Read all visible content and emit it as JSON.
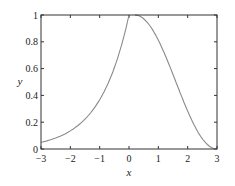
{
  "chart_data": {
    "type": "line",
    "title": "",
    "xlabel": "x",
    "ylabel": "y",
    "xlim": [
      -3,
      3
    ],
    "ylim": [
      0,
      1
    ],
    "xticks": [
      "-3",
      "-2",
      "-1",
      "0",
      "1",
      "2",
      "3"
    ],
    "yticks": [
      "0",
      "0.2",
      "0.4",
      "0.6",
      "0.8",
      "1"
    ],
    "grid": false,
    "legend": null,
    "series": [
      {
        "name": "left branch",
        "x": [
          -3,
          -2.5,
          -2,
          -1.5,
          -1,
          -0.5,
          0
        ],
        "y": [
          0.05,
          0.08,
          0.14,
          0.22,
          0.37,
          0.61,
          1.0
        ]
      },
      {
        "name": "right branch",
        "x": [
          0.2,
          0.5,
          1,
          1.5,
          2,
          2.5,
          3
        ],
        "y": [
          1.0,
          0.97,
          0.63,
          0.42,
          0.23,
          0.08,
          0.0
        ]
      }
    ],
    "line_color": "#8a8a8a"
  }
}
